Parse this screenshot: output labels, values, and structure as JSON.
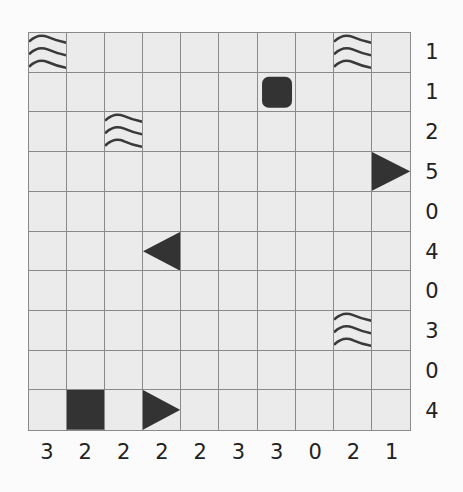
{
  "puzzle": {
    "type": "battleship",
    "size": 10,
    "row_clues": [
      "1",
      "1",
      "2",
      "5",
      "0",
      "4",
      "0",
      "3",
      "0",
      "4"
    ],
    "col_clues": [
      "3",
      "2",
      "2",
      "2",
      "2",
      "3",
      "3",
      "0",
      "2",
      "1"
    ],
    "cells": [
      {
        "row": 0,
        "col": 0,
        "kind": "water"
      },
      {
        "row": 0,
        "col": 8,
        "kind": "water"
      },
      {
        "row": 1,
        "col": 6,
        "kind": "submarine"
      },
      {
        "row": 2,
        "col": 2,
        "kind": "water"
      },
      {
        "row": 3,
        "col": 9,
        "kind": "end-right"
      },
      {
        "row": 5,
        "col": 3,
        "kind": "end-left"
      },
      {
        "row": 7,
        "col": 8,
        "kind": "water"
      },
      {
        "row": 9,
        "col": 1,
        "kind": "middle"
      },
      {
        "row": 9,
        "col": 3,
        "kind": "end-right"
      }
    ],
    "colors": {
      "cell_bg": "#ebebeb",
      "grid_line": "#8a8a8a",
      "ship": "#333333",
      "water": "#3a3a3a",
      "clue_text": "#222222"
    }
  }
}
